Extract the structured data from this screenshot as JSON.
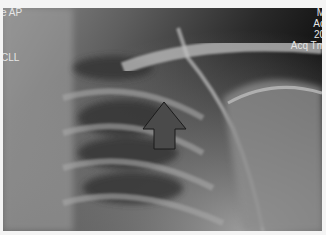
{
  "image": {
    "description": "Chest X-ray (clavicle / shoulder region) with arrow annotation",
    "annotation": {
      "type": "arrow-up",
      "color": "#4a4a4a"
    }
  },
  "overlay": {
    "top_left": [
      "e AP"
    ],
    "mid_left": [
      "CLL"
    ],
    "top_right": [
      "M",
      "Ac",
      "20",
      "Acq Tm"
    ]
  }
}
